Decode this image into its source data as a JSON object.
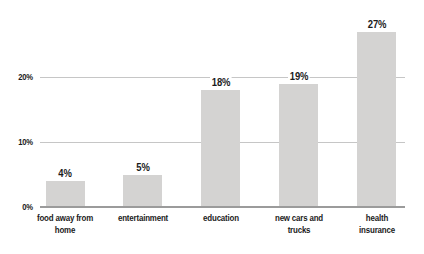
{
  "chart_data": {
    "type": "bar",
    "title": "",
    "xlabel": "",
    "ylabel": "",
    "categories": [
      "food away from\nhome",
      "entertainment",
      "education",
      "new cars and\ntrucks",
      "health insurance"
    ],
    "values": [
      4,
      5,
      18,
      19,
      27
    ],
    "value_labels": [
      "4%",
      "5%",
      "18%",
      "19%",
      "27%"
    ],
    "yticks": [
      {
        "label": "0%",
        "value": 0
      },
      {
        "label": "10%",
        "value": 10
      },
      {
        "label": "20%",
        "value": 20
      }
    ],
    "ylim": [
      0,
      30
    ],
    "grid": "horizontal",
    "legend": "none",
    "colors": {
      "bar": "#d4d3d2",
      "axis_line": "#9b9b9b",
      "gridline": "#c6c6c6",
      "text": "#1b1b1b",
      "background": "#ffffff"
    }
  }
}
